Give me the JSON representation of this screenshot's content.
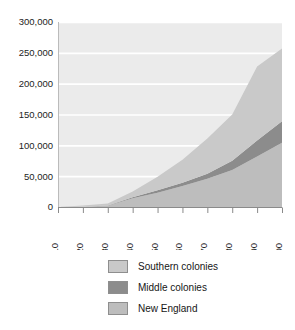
{
  "chart_data": {
    "type": "area",
    "stacked": true,
    "title": "",
    "subtitle": "",
    "xlabel": "",
    "ylabel": "",
    "x": [
      1610,
      1620,
      1630,
      1640,
      1650,
      1660,
      1670,
      1680,
      1690,
      1700
    ],
    "xtick_labels": [
      "1610",
      "1620",
      "1630",
      "1640",
      "1650",
      "1660",
      "1670",
      "1680",
      "1690",
      "1700"
    ],
    "ytick_labels": [
      "0",
      "50,000",
      "100,000",
      "150,000",
      "200,000",
      "250,000",
      "300,000"
    ],
    "ytick_values": [
      0,
      50000,
      100000,
      150000,
      200000,
      250000,
      300000
    ],
    "xlim": [
      1610,
      1700
    ],
    "ylim": [
      0,
      300000
    ],
    "grid": "horizontal",
    "legend_position": "bottom",
    "series": [
      {
        "name": "New England",
        "color": "#bdbdbd",
        "values": [
          0,
          500,
          2000,
          14000,
          23000,
          34000,
          46000,
          60000,
          82000,
          104000
        ]
      },
      {
        "name": "Middle colonies",
        "color": "#8c8c8c",
        "values": [
          0,
          0,
          500,
          2000,
          4000,
          5500,
          8000,
          15000,
          26000,
          35000
        ]
      },
      {
        "name": "Southern colonies",
        "color": "#c9c9c9",
        "values": [
          0,
          2000,
          3000,
          9000,
          22000,
          37000,
          57000,
          75000,
          120000,
          118000
        ]
      }
    ],
    "cumulative_totals": [
      0,
      2500,
      5500,
      25000,
      49000,
      76500,
      111000,
      150000,
      228000,
      257000
    ],
    "colors": {
      "plot_background": "#ebebeb",
      "gridline": "#ffffff",
      "axis": "#7a7a7a",
      "text": "#1a1a1a"
    }
  },
  "legend": {
    "items": [
      {
        "label": "Southern colonies",
        "swatch": "#c9c9c9"
      },
      {
        "label": "Middle colonies",
        "swatch": "#8c8c8c"
      },
      {
        "label": "New England",
        "swatch": "#bdbdbd"
      }
    ]
  }
}
